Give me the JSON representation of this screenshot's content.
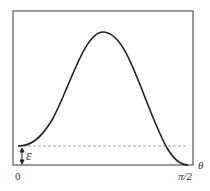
{
  "figure": {
    "type": "curve-diagram",
    "axis": {
      "x_label": "θ",
      "x_ticks": [
        "0",
        "π/2"
      ]
    },
    "annotation": {
      "symbol": "ε",
      "meaning": "offset between curve minimum at 0 and baseline at π/2"
    },
    "colors": {
      "frame": "#333333",
      "curve": "#222222",
      "dashed": "#888888"
    }
  }
}
